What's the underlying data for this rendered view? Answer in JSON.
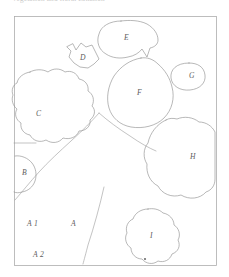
{
  "caption": {
    "text": "Vegetation and floral zonation"
  },
  "figure": {
    "frame": {
      "x": 14,
      "y": 16,
      "width": 202,
      "height": 249,
      "color": "#adadad"
    },
    "outline_color": "#8c8c8c",
    "terrain_color": "#9a9a9a",
    "label_color": "#5d5d5d",
    "background": "#ffffff"
  },
  "regions": [
    {
      "id": "A",
      "label": "A",
      "label_x": 71,
      "label_y": 226
    },
    {
      "id": "A1",
      "label": "A 1",
      "label_x": 27,
      "label_y": 226
    },
    {
      "id": "A2",
      "label": "A 2",
      "label_x": 33,
      "label_y": 257
    },
    {
      "id": "B",
      "label": "B",
      "label_x": 22,
      "label_y": 175
    },
    {
      "id": "C",
      "label": "C",
      "label_x": 36,
      "label_y": 116
    },
    {
      "id": "D",
      "label": "D",
      "label_x": 80,
      "label_y": 60
    },
    {
      "id": "E",
      "label": "E",
      "label_x": 124,
      "label_y": 40
    },
    {
      "id": "F",
      "label": "F",
      "label_x": 137,
      "label_y": 95
    },
    {
      "id": "G",
      "label": "G",
      "label_x": 189,
      "label_y": 78
    },
    {
      "id": "H",
      "label": "H",
      "label_x": 190,
      "label_y": 159
    },
    {
      "id": "I",
      "label": "I",
      "label_x": 150,
      "label_y": 238
    }
  ],
  "markers": [
    {
      "id": "marker-i",
      "x": 145,
      "y": 259
    }
  ]
}
